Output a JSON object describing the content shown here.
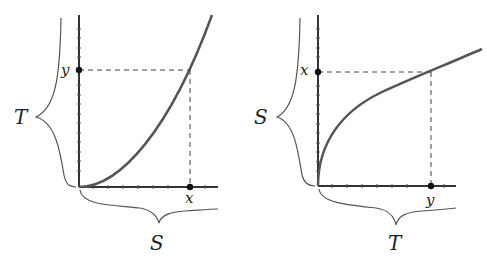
{
  "panels": [
    {
      "id": "left",
      "curve": "convex increasing (x^2-like)",
      "brace_vertical_label": "T",
      "brace_horizontal_label": "S",
      "axis_marker_vertical": "y",
      "axis_marker_horizontal": "x"
    },
    {
      "id": "right",
      "curve": "concave increasing (sqrt-like)",
      "brace_vertical_label": "S",
      "brace_horizontal_label": "T",
      "axis_marker_vertical": "x",
      "axis_marker_horizontal": "y"
    }
  ],
  "colors": {
    "curve": "#555555",
    "axis": "#333333",
    "dashed": "#444444",
    "brace": "#555555"
  }
}
